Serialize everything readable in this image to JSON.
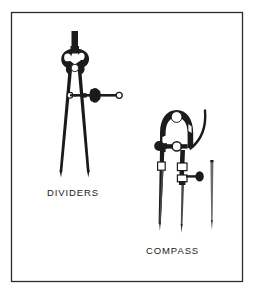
{
  "figure": {
    "background_color": "#ffffff",
    "ink_color": "#1b1b1b",
    "border": {
      "name": "figure-border",
      "style": "thin rectangular rule",
      "color": "#2b2b2b",
      "stroke_width": 1.3,
      "x": 11,
      "y": 12,
      "width": 232,
      "height": 270
    },
    "labels": [
      {
        "id": "dividers",
        "text": "DIVIDERS",
        "x": 47,
        "y": 196,
        "font_size": 9.5,
        "letter_spacing": 0.9
      },
      {
        "id": "compass",
        "text": "COMPASS",
        "x": 146,
        "y": 254,
        "font_size": 9.5,
        "letter_spacing": 0.9
      }
    ],
    "objects": [
      {
        "id": "dividers",
        "name": "dividers-instrument",
        "label": "DIVIDERS",
        "description": "Spring-bow dividers with dark handle, pivot head, horizontal adjusting rod with knurled thumb nut, and two tapered steel points",
        "parts": [
          "top-handle",
          "pivot-head",
          "left-leg",
          "right-leg",
          "adjusting-rod",
          "knurled-thumb-nut",
          "rod-eyelet",
          "left-point",
          "right-point"
        ]
      },
      {
        "id": "compass",
        "name": "compass-instrument",
        "label": "COMPASS",
        "description": "Bow compass with arched head, curved extension arm, side adjusting screw with knob, needle leg and pencil-lead leg",
        "parts": [
          "arched-head",
          "head-pivot-disc",
          "curved-extension-arm",
          "left-shoulder-knob",
          "center-hinge",
          "adjusting-screw",
          "screw-knob",
          "needle-leg",
          "lead-leg",
          "needle-point",
          "lead-point"
        ]
      },
      {
        "id": "spare-point",
        "name": "spare-point-accessory",
        "label": "",
        "description": "Separate straight replacement needle point shown at right",
        "parts": [
          "shaft",
          "tip"
        ]
      }
    ]
  }
}
